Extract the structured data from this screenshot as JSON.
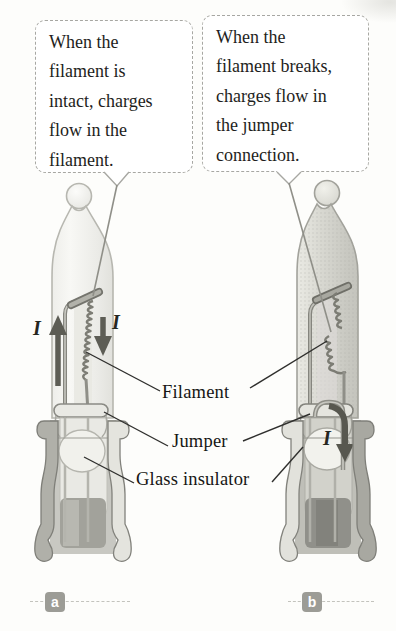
{
  "figure": {
    "callouts": [
      {
        "panel": "a",
        "lines": [
          "When the",
          "filament is",
          "intact, charges",
          "flow in the",
          "filament."
        ]
      },
      {
        "panel": "b",
        "lines": [
          "When the",
          "filament breaks,",
          "charges flow in",
          "the jumper",
          "connection."
        ]
      }
    ],
    "part_labels": {
      "filament": "Filament",
      "jumper": "Jumper",
      "glass_insulator": "Glass insulator"
    },
    "current_symbol": "I",
    "panel_tags": {
      "a": "a",
      "b": "b"
    },
    "colors": {
      "background": "#fdfdfb",
      "callout_border": "#a7a7a2",
      "text": "#1e1e1c",
      "leader_line": "#2f2f2d",
      "callout_leader": "#8f8f88",
      "glass_light": "#f3f3f0",
      "glass_dark": "#d5d5ce",
      "metal_gray": "#a8a8a1",
      "arrow_gray": "#5d5d55",
      "badge_gray": "#9c9c96",
      "badge_text": "#ffffff"
    }
  }
}
